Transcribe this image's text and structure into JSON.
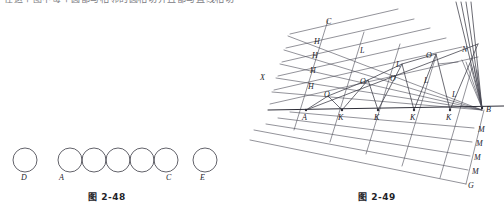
{
  "page": {
    "background_color": "#ffffff",
    "ink_color": "#3a3a44",
    "header_text_cropped": "在这个图中每个圆都与相邻的圆相切并且都与直线相切"
  },
  "figures": [
    {
      "id": "fig-2-48",
      "caption": "图 2-48",
      "type": "tangent-circles-diagram",
      "description": "A row of circles: one isolated circle labeled D, a chain of five mutually tangent circles whose first is labeled A and last labeled C, and one isolated circle labeled E.",
      "labels": [
        "D",
        "A",
        "C",
        "E"
      ],
      "circles": [
        {
          "label": "D",
          "cx": 25,
          "cy": 30,
          "r": 12
        },
        {
          "label": "A",
          "cx": 70,
          "cy": 30,
          "r": 12
        },
        {
          "label": "",
          "cx": 94,
          "cy": 30,
          "r": 12
        },
        {
          "label": "",
          "cx": 118,
          "cy": 30,
          "r": 12
        },
        {
          "label": "",
          "cx": 142,
          "cy": 30,
          "r": 12
        },
        {
          "label": "C",
          "cx": 166,
          "cy": 30,
          "r": 12
        },
        {
          "label": "E",
          "cx": 205,
          "cy": 30,
          "r": 12
        }
      ],
      "label_positions": [
        {
          "text": "D",
          "x": 21,
          "y": 50
        },
        {
          "text": "A",
          "x": 59,
          "y": 50
        },
        {
          "text": "C",
          "x": 166,
          "y": 50
        },
        {
          "text": "E",
          "x": 200,
          "y": 50
        }
      ]
    },
    {
      "id": "fig-2-49",
      "caption": "图 2-49",
      "type": "geometric-construction-diagram",
      "description": "An inclined construction of parallel rulings between ray X-A-B and a lower band, with a zigzag of triangles along baseline A-K-K-K-K-B, labeled points C, H (four), L, O, N, M (four), G.",
      "baseline": {
        "from": "A",
        "to": "B"
      },
      "labels": {
        "X": {
          "x": 12,
          "y": 78
        },
        "C": {
          "x": 78,
          "y": 22
        },
        "H": [
          {
            "x": 66,
            "y": 42
          },
          {
            "x": 64,
            "y": 55
          },
          {
            "x": 62,
            "y": 70
          },
          {
            "x": 60,
            "y": 85
          }
        ],
        "A": {
          "x": 55,
          "y": 116
        },
        "K": [
          {
            "x": 88,
            "y": 116
          },
          {
            "x": 124,
            "y": 116
          },
          {
            "x": 160,
            "y": 116
          },
          {
            "x": 196,
            "y": 116
          }
        ],
        "O": [
          {
            "x": 74,
            "y": 96
          },
          {
            "x": 110,
            "y": 83
          },
          {
            "x": 140,
            "y": 80
          },
          {
            "x": 176,
            "y": 57
          }
        ],
        "L": [
          {
            "x": 110,
            "y": 52
          },
          {
            "x": 146,
            "y": 66
          },
          {
            "x": 174,
            "y": 82
          },
          {
            "x": 202,
            "y": 96
          }
        ],
        "N": {
          "x": 212,
          "y": 50
        },
        "B": {
          "x": 234,
          "y": 110
        },
        "M": [
          {
            "x": 228,
            "y": 130
          },
          {
            "x": 226,
            "y": 144
          },
          {
            "x": 224,
            "y": 158
          },
          {
            "x": 222,
            "y": 172
          }
        ],
        "G": {
          "x": 218,
          "y": 186
        }
      }
    }
  ]
}
